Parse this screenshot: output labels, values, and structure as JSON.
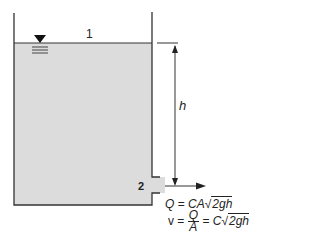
{
  "diagram": {
    "type": "tank-orifice-discharge",
    "colors": {
      "water": "#dcdcdc",
      "lines": "#333333",
      "background": "#ffffff"
    },
    "labels": {
      "point_1": "1",
      "point_2": "2",
      "height": "h"
    },
    "equations": {
      "discharge": {
        "lhs": "Q",
        "eq": "=",
        "rhs_prefix": "CA",
        "radical": "√",
        "radicand": "2gh"
      },
      "velocity": {
        "lhs": "v",
        "eq1": "=",
        "num": "Q",
        "den": "A",
        "eq2": "=",
        "rhs_prefix": "C",
        "radical": "√",
        "radicand": "2gh"
      }
    },
    "icons": {
      "water_surface": "free-surface-triangle-icon"
    }
  }
}
